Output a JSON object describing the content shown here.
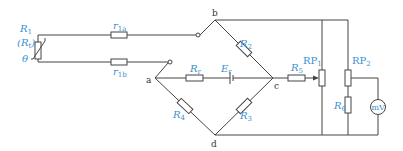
{
  "diagram": {
    "type": "circuit-schematic",
    "components": {
      "R1": {
        "label": "R",
        "sub": "1",
        "alt_label": "(R",
        "alt_sub": "t",
        "alt_close": ")"
      },
      "theta": {
        "label": "θ"
      },
      "r1a": {
        "label": "r",
        "sub": "1a"
      },
      "r1b": {
        "label": "r",
        "sub": "1b"
      },
      "R2": {
        "label": "R",
        "sub": "2"
      },
      "R3": {
        "label": "R",
        "sub": "3"
      },
      "R4": {
        "label": "R",
        "sub": "4"
      },
      "Rr": {
        "label": "R",
        "sub": "r"
      },
      "Er": {
        "label": "E",
        "sub": "r"
      },
      "R5": {
        "label": "R",
        "sub": "5"
      },
      "RP1": {
        "label": "RP",
        "sub": "1"
      },
      "RP2": {
        "label": "RP",
        "sub": "2"
      },
      "R6": {
        "label": "R",
        "sub": "6"
      },
      "meter": {
        "label": "mV"
      }
    },
    "nodes": {
      "a": "a",
      "b": "b",
      "c": "c",
      "d": "d"
    },
    "colors": {
      "label": "#3b8fd0",
      "wire": "#444444",
      "node_label": "#333333"
    }
  }
}
